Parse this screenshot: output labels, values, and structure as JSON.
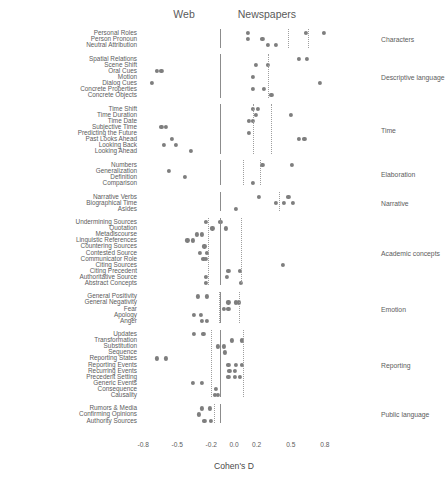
{
  "chart_data": {
    "type": "scatter",
    "title": "",
    "xlabel": "Cohen's D",
    "ylabel": "",
    "xlim": [
      -0.95,
      0.95
    ],
    "xticks": [
      -0.8,
      -0.5,
      -0.2,
      0.0,
      0.2,
      0.5,
      0.8
    ],
    "xticklabels": [
      "-0.8",
      "-0.5",
      "-0.2",
      "0.0",
      "0.2",
      "0.5",
      "0.8"
    ],
    "grid": false,
    "legend": "none",
    "panel_titles": [
      {
        "label": "Web",
        "x": -0.44
      },
      {
        "label": "Newspapers",
        "x": 0.29
      }
    ],
    "reference_lines": {
      "solid": {
        "color": "#8c8c8c",
        "note": "group separator line near x=-0.12"
      },
      "dotted": {
        "color": "#9e9e9e",
        "note": "per-group dotted reference lines"
      }
    },
    "point_color": "#7e7e7e",
    "groups": [
      {
        "name": "Characters",
        "solid_line": -0.12,
        "dotted_lines": [
          0.48,
          0.65
        ],
        "rows": [
          {
            "label": "Personal Roles",
            "values": [
              0.12,
              0.63,
              0.79
            ]
          },
          {
            "label": "Person Pronoun",
            "values": [
              0.12,
              0.25
            ]
          },
          {
            "label": "Neutral Attribution",
            "values": [
              0.3,
              0.37
            ]
          }
        ]
      },
      {
        "name": "Descriptive language",
        "solid_line": -0.12,
        "dotted_lines": [
          0.3
        ],
        "rows": [
          {
            "label": "Spatial Relations",
            "values": [
              0.57,
              0.64
            ]
          },
          {
            "label": "Scene Shift",
            "values": [
              0.19,
              0.3
            ]
          },
          {
            "label": "Oral Cues",
            "values": [
              -0.68,
              -0.64
            ]
          },
          {
            "label": "Motion",
            "values": [
              0.17
            ]
          },
          {
            "label": "Dialog Cues",
            "values": [
              -0.72,
              0.76
            ]
          },
          {
            "label": "Concrete Properties",
            "values": [
              0.17,
              0.26
            ]
          },
          {
            "label": "Concrete Objects",
            "values": [
              0.33
            ]
          }
        ]
      },
      {
        "name": "Time",
        "solid_line": -0.12,
        "dotted_lines": [
          0.17,
          0.33
        ],
        "rows": [
          {
            "label": "Time Shift",
            "values": [
              0.17,
              0.21
            ]
          },
          {
            "label": "Time Duration",
            "values": [
              0.19,
              0.5
            ]
          },
          {
            "label": "Time Date",
            "values": [
              0.13,
              0.17
            ]
          },
          {
            "label": "Subjective Time",
            "values": [
              -0.64,
              -0.6
            ]
          },
          {
            "label": "Predicting the Future",
            "values": [
              0.13
            ]
          },
          {
            "label": "Past Looks Ahead",
            "values": [
              -0.55,
              0.57,
              0.62
            ]
          },
          {
            "label": "Looking Back",
            "values": [
              -0.62,
              -0.51
            ]
          },
          {
            "label": "Looking Ahead",
            "values": [
              -0.38
            ]
          }
        ]
      },
      {
        "name": "Elaboration",
        "solid_line": -0.12,
        "dotted_lines": [
          0.08,
          0.23
        ],
        "rows": [
          {
            "label": "Numbers",
            "values": [
              0.25,
              0.51
            ]
          },
          {
            "label": "Generalization",
            "values": [
              -0.57
            ]
          },
          {
            "label": "Definition",
            "values": [
              -0.43
            ]
          },
          {
            "label": "Comparison",
            "values": [
              0.17
            ]
          }
        ]
      },
      {
        "name": "Narrative",
        "solid_line": -0.12,
        "dotted_lines": [
          0.4
        ],
        "rows": [
          {
            "label": "Narrative Verbs",
            "values": [
              0.22,
              0.48
            ]
          },
          {
            "label": "Biographical Time",
            "values": [
              0.37,
              0.44,
              0.52
            ]
          },
          {
            "label": "Asides",
            "values": [
              0.02
            ]
          }
        ]
      },
      {
        "name": "Academic concepts",
        "solid_line": -0.12,
        "dotted_lines": [
          -0.23,
          0.06
        ],
        "rows": [
          {
            "label": "Undermining Sources",
            "values": [
              -0.25,
              -0.12
            ]
          },
          {
            "label": "Quotation",
            "values": [
              -0.19,
              -0.07
            ]
          },
          {
            "label": "Metadiscourse",
            "values": [
              -0.33,
              -0.28
            ]
          },
          {
            "label": "Linguistic References",
            "values": [
              -0.41,
              -0.36
            ]
          },
          {
            "label": "Countering Sources",
            "values": [
              -0.26
            ]
          },
          {
            "label": "Contested Source",
            "values": [
              -0.3,
              -0.24
            ]
          },
          {
            "label": "Communicator Role",
            "values": [
              -0.27,
              -0.25
            ]
          },
          {
            "label": "Citing Sources",
            "values": [
              0.43
            ]
          },
          {
            "label": "Citing Precedent",
            "values": [
              -0.05,
              0.05
            ]
          },
          {
            "label": "Authoritative Source",
            "values": [
              -0.25,
              -0.06
            ]
          },
          {
            "label": "Abstract Concepts",
            "values": [
              -0.25,
              0.06
            ]
          }
        ]
      },
      {
        "name": "Emotion",
        "solid_line": -0.12,
        "dotted_lines": [
          -0.13,
          0.04
        ],
        "rows": [
          {
            "label": "General Positivity",
            "values": [
              -0.32,
              -0.24
            ]
          },
          {
            "label": "General Negativity",
            "values": [
              -0.05,
              0.02,
              0.04
            ]
          },
          {
            "label": "Fear",
            "values": [
              -0.09,
              -0.05
            ]
          },
          {
            "label": "Apology",
            "values": [
              -0.35,
              -0.29
            ]
          },
          {
            "label": "Anger",
            "values": [
              -0.28,
              -0.24
            ]
          }
        ]
      },
      {
        "name": "Reporting",
        "solid_line": -0.12,
        "dotted_lines": [
          -0.2,
          0.08
        ],
        "rows": [
          {
            "label": "Updates",
            "values": [
              -0.35,
              -0.27
            ]
          },
          {
            "label": "Transformation",
            "values": [
              -0.02,
              0.07
            ]
          },
          {
            "label": "Substitution",
            "values": [
              -0.14,
              -0.09
            ]
          },
          {
            "label": "Sequence",
            "values": [
              -0.08
            ]
          },
          {
            "label": "Reporting States",
            "values": [
              -0.68,
              -0.6
            ]
          },
          {
            "label": "Reporting Events",
            "values": [
              -0.05,
              0.02,
              0.07
            ]
          },
          {
            "label": "Recurring Events",
            "values": [
              -0.04,
              0.01
            ]
          },
          {
            "label": "Precedent Setting",
            "values": [
              -0.05,
              0.01,
              0.05
            ]
          },
          {
            "label": "Generic Events",
            "values": [
              -0.36,
              -0.28
            ]
          },
          {
            "label": "Consequence",
            "values": [
              -0.16
            ]
          },
          {
            "label": "Causality",
            "values": [
              -0.17,
              -0.14
            ]
          }
        ]
      },
      {
        "name": "Public language",
        "solid_line": -0.12,
        "dotted_lines": [
          -0.18
        ],
        "rows": [
          {
            "label": "Rumors & Media",
            "values": [
              -0.28,
              -0.21
            ]
          },
          {
            "label": "Confirming Opinions",
            "values": [
              -0.31
            ]
          },
          {
            "label": "Authority Sources",
            "values": [
              -0.26,
              -0.2
            ]
          }
        ]
      }
    ]
  }
}
